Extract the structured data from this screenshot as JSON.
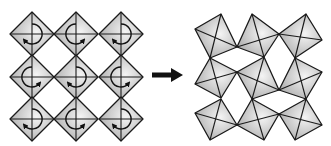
{
  "diagram": {
    "type": "octahedral-tilting",
    "colors": {
      "stroke": "#1a1a1a",
      "fill_light": "#f4f4f4",
      "fill_dark": "#a8a8a8",
      "arrow": "#111111",
      "background": "#ffffff"
    },
    "left_panel": {
      "label": "untilted octahedra with rotation arrows",
      "half_size": 22,
      "centers_x": [
        32,
        76,
        121
      ],
      "centers_y": [
        34,
        77,
        119
      ],
      "rotations": [
        [
          "bl",
          "br",
          "bl"
        ],
        [
          "br",
          "bl",
          "br"
        ],
        [
          "bl",
          "br",
          "bl"
        ]
      ]
    },
    "transition_arrow": {
      "label": "transforms to",
      "from": [
        152,
        75
      ],
      "to": [
        183,
        75
      ]
    },
    "right_panel": {
      "label": "tilted octahedra",
      "squares": [
        [
          [
            195,
            29
          ],
          [
            221,
            14
          ],
          [
            237,
            47
          ],
          [
            210,
            58
          ]
        ],
        [
          [
            237,
            47
          ],
          [
            252,
            14
          ],
          [
            279,
            34
          ],
          [
            264,
            57
          ]
        ],
        [
          [
            279,
            34
          ],
          [
            306,
            14
          ],
          [
            322,
            40
          ],
          [
            295,
            58
          ]
        ],
        [
          [
            195,
            84
          ],
          [
            210,
            58
          ],
          [
            237,
            72
          ],
          [
            221,
            98
          ]
        ],
        [
          [
            237,
            72
          ],
          [
            264,
            57
          ],
          [
            279,
            90
          ],
          [
            252,
            99
          ]
        ],
        [
          [
            279,
            90
          ],
          [
            295,
            58
          ],
          [
            322,
            72
          ],
          [
            306,
            99
          ]
        ],
        [
          [
            195,
            113
          ],
          [
            221,
            99
          ],
          [
            237,
            125
          ],
          [
            210,
            140
          ]
        ],
        [
          [
            237,
            125
          ],
          [
            252,
            99
          ],
          [
            279,
            114
          ],
          [
            264,
            140
          ]
        ],
        [
          [
            279,
            114
          ],
          [
            306,
            99
          ],
          [
            322,
            125
          ],
          [
            295,
            140
          ]
        ]
      ]
    }
  }
}
